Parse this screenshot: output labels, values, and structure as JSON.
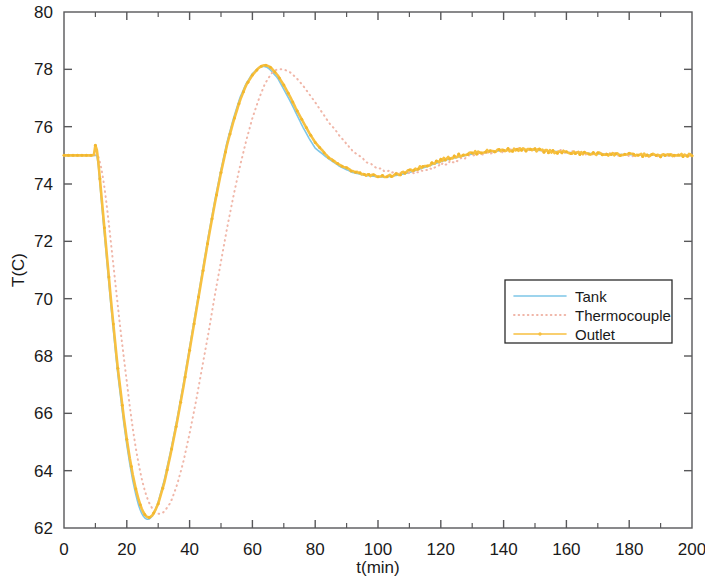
{
  "chart_data": {
    "type": "line",
    "title": "",
    "xlabel": "t(min)",
    "ylabel": "T(C)",
    "xlim": [
      0,
      200
    ],
    "ylim": [
      62,
      80
    ],
    "xticks": [
      0,
      20,
      40,
      60,
      80,
      100,
      120,
      140,
      160,
      180,
      200
    ],
    "xtick_labels": [
      "0",
      "20",
      "40",
      "60",
      "80",
      "100",
      "120",
      "140",
      "160",
      "180",
      "200"
    ],
    "xminor_step": 10,
    "yticks": [
      62,
      64,
      66,
      68,
      70,
      72,
      74,
      76,
      78,
      80
    ],
    "ytick_labels": [
      "62",
      "64",
      "66",
      "68",
      "70",
      "72",
      "74",
      "76",
      "78",
      "80"
    ],
    "grid": false,
    "legend_position": "center-right",
    "legend_entries": [
      "Tank",
      "Thermocouple",
      "Outlet"
    ],
    "series": [
      {
        "name": "Tank",
        "color": "#7ec6e8",
        "style": "solid",
        "marker": "none",
        "linewidth": 1.6,
        "x": [
          0,
          2,
          4,
          6,
          8,
          10,
          10.5,
          11,
          12,
          13,
          14,
          15,
          16,
          17,
          18,
          19,
          20,
          21,
          22,
          23,
          24,
          25,
          26,
          27,
          28,
          29,
          30,
          32,
          34,
          36,
          38,
          40,
          42,
          44,
          46,
          48,
          50,
          52,
          54,
          56,
          58,
          60,
          62,
          63,
          64,
          65,
          66,
          68,
          70,
          72,
          74,
          76,
          78,
          80,
          84,
          88,
          92,
          96,
          100,
          103,
          106,
          110,
          114,
          118,
          122,
          126,
          130,
          134,
          138,
          142,
          146,
          150,
          155,
          160,
          165,
          170,
          175,
          180,
          185,
          190,
          195,
          200
        ],
        "y": [
          75.0,
          75.0,
          75.0,
          75.0,
          75.0,
          75.0,
          75.0,
          74.6,
          73.3,
          72.1,
          70.9,
          69.7,
          68.6,
          67.5,
          66.6,
          65.7,
          64.9,
          64.2,
          63.6,
          63.1,
          62.7,
          62.45,
          62.32,
          62.3,
          62.4,
          62.6,
          62.9,
          63.7,
          64.7,
          65.8,
          67.0,
          68.3,
          69.6,
          70.9,
          72.2,
          73.4,
          74.5,
          75.5,
          76.3,
          77.0,
          77.5,
          77.85,
          78.05,
          78.1,
          78.1,
          78.05,
          77.95,
          77.7,
          77.3,
          76.9,
          76.45,
          76.0,
          75.6,
          75.25,
          74.9,
          74.6,
          74.4,
          74.3,
          74.25,
          74.25,
          74.3,
          74.4,
          74.55,
          74.7,
          74.85,
          74.95,
          75.05,
          75.1,
          75.15,
          75.18,
          75.2,
          75.18,
          75.15,
          75.1,
          75.08,
          75.05,
          75.03,
          75.02,
          75.01,
          75.0,
          75.0,
          75.0
        ]
      },
      {
        "name": "Thermocouple",
        "color": "#f0b6a8",
        "style": "dotted",
        "marker": "none",
        "linewidth": 2.0,
        "x": [
          0,
          2,
          4,
          6,
          8,
          10,
          11,
          12,
          13,
          14,
          15,
          16,
          17,
          18,
          19,
          20,
          21,
          22,
          23,
          24,
          25,
          26,
          27,
          28,
          29,
          30,
          31,
          32,
          34,
          36,
          38,
          40,
          42,
          44,
          46,
          48,
          50,
          52,
          54,
          56,
          58,
          60,
          62,
          64,
          66,
          67,
          68,
          70,
          72,
          74,
          76,
          78,
          80,
          84,
          88,
          92,
          96,
          100,
          104,
          108,
          112,
          116,
          120,
          124,
          128,
          132,
          136,
          140,
          145,
          150,
          155,
          160,
          165,
          170,
          175,
          180,
          185,
          190,
          195,
          200
        ],
        "y": [
          75.0,
          75.0,
          75.0,
          75.0,
          75.0,
          75.0,
          74.95,
          74.5,
          73.8,
          72.9,
          71.9,
          70.9,
          69.9,
          68.9,
          68.0,
          67.1,
          66.2,
          65.4,
          64.7,
          64.1,
          63.6,
          63.2,
          62.9,
          62.7,
          62.55,
          62.5,
          62.5,
          62.58,
          62.9,
          63.5,
          64.3,
          65.3,
          66.4,
          67.6,
          68.8,
          70.1,
          71.3,
          72.5,
          73.6,
          74.6,
          75.5,
          76.3,
          76.95,
          77.5,
          77.85,
          77.95,
          78.0,
          78.0,
          77.9,
          77.7,
          77.45,
          77.15,
          76.85,
          76.2,
          75.65,
          75.15,
          74.8,
          74.55,
          74.4,
          74.35,
          74.4,
          74.5,
          74.65,
          74.8,
          74.92,
          75.02,
          75.1,
          75.15,
          75.2,
          75.18,
          75.15,
          75.12,
          75.08,
          75.05,
          75.03,
          75.02,
          75.01,
          75.0,
          75.0,
          75.0
        ]
      },
      {
        "name": "Outlet",
        "color": "#f7c040",
        "style": "solid",
        "marker": "dot",
        "linewidth": 2.6,
        "x": [
          0,
          2,
          4,
          6,
          8,
          9.5,
          10,
          10.3,
          10.6,
          11,
          12,
          13,
          14,
          15,
          16,
          17,
          18,
          19,
          20,
          21,
          22,
          23,
          24,
          25,
          26,
          27,
          28,
          29,
          30,
          32,
          34,
          36,
          38,
          40,
          42,
          44,
          46,
          48,
          50,
          52,
          54,
          56,
          58,
          60,
          62,
          63,
          64,
          65,
          66,
          68,
          70,
          72,
          74,
          76,
          78,
          80,
          84,
          88,
          92,
          96,
          100,
          103,
          106,
          110,
          114,
          118,
          122,
          126,
          130,
          134,
          138,
          142,
          146,
          150,
          155,
          160,
          165,
          170,
          175,
          180,
          185,
          190,
          195,
          200
        ],
        "y": [
          75.0,
          75.0,
          75.0,
          75.0,
          75.0,
          75.0,
          75.35,
          75.3,
          75.1,
          74.7,
          73.5,
          72.3,
          71.1,
          69.9,
          68.8,
          67.7,
          66.8,
          65.9,
          65.1,
          64.4,
          63.8,
          63.3,
          62.9,
          62.6,
          62.42,
          62.36,
          62.42,
          62.6,
          62.85,
          63.6,
          64.6,
          65.7,
          66.9,
          68.2,
          69.5,
          70.8,
          72.1,
          73.3,
          74.4,
          75.4,
          76.2,
          76.9,
          77.45,
          77.8,
          78.05,
          78.12,
          78.15,
          78.12,
          78.05,
          77.8,
          77.45,
          77.05,
          76.6,
          76.2,
          75.8,
          75.45,
          74.95,
          74.65,
          74.45,
          74.32,
          74.28,
          74.27,
          74.32,
          74.45,
          74.6,
          74.75,
          74.9,
          75.0,
          75.08,
          75.13,
          75.17,
          75.19,
          75.2,
          75.18,
          75.14,
          75.1,
          75.07,
          75.05,
          75.04,
          75.02,
          75.01,
          75.0,
          75.0,
          75.0
        ]
      }
    ],
    "noise_note": "outlet and thermocouple traces carry small measurement noise after t=85"
  },
  "axes": {
    "ylabel": "T(C)",
    "xlabel": "t(min)"
  },
  "legend": {
    "items": [
      {
        "label": "Tank",
        "color": "#7ec6e8",
        "style": "solid"
      },
      {
        "label": "Thermocouple",
        "color": "#f0b6a8",
        "style": "dotted"
      },
      {
        "label": "Outlet",
        "color": "#f7c040",
        "style": "solid-marker"
      }
    ]
  },
  "colors": {
    "background": "#ffffff",
    "axis": "#58585a",
    "text": "#1a1a1a",
    "tank": "#7ec6e8",
    "thermocouple": "#f0b6a8",
    "outlet": "#f7c040"
  }
}
